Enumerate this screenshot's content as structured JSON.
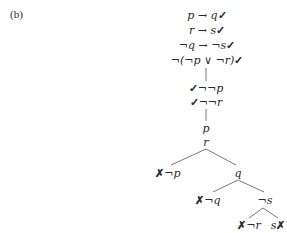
{
  "panel_label": "(b)",
  "premises": [
    {
      "text": "p → q",
      "mark": "✓"
    },
    {
      "text": "r → s",
      "mark": "✓"
    },
    {
      "text": "¬q → ¬s",
      "mark": "✓"
    },
    {
      "text": "¬(¬p ∨ ¬r)",
      "mark": "✓"
    }
  ],
  "derived": [
    {
      "text": "¬¬p",
      "mark": "✓"
    },
    {
      "text": "¬¬r",
      "mark": "✓"
    }
  ],
  "atoms": [
    "p",
    "r"
  ],
  "branch1": {
    "left": {
      "text": "¬p",
      "mark": "✗"
    },
    "right": {
      "text": "q"
    }
  },
  "branch2": {
    "left": {
      "text": "¬q",
      "mark": "✗"
    },
    "right": {
      "text": "¬s"
    }
  },
  "branch3": {
    "left": {
      "text": "¬r",
      "mark": "✗"
    },
    "right": {
      "text": "s",
      "mark": "✗"
    }
  }
}
